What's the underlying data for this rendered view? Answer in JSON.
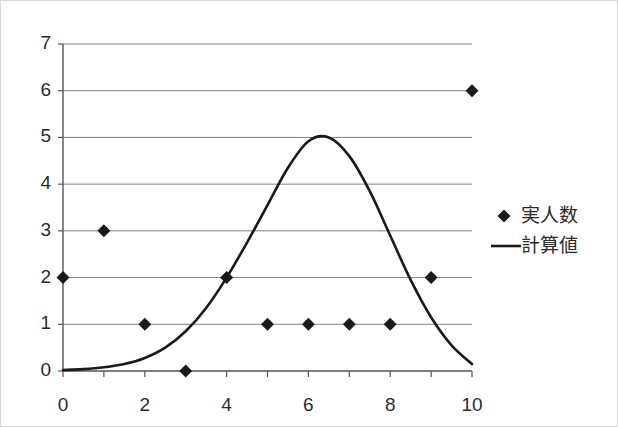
{
  "chart_data": {
    "type": "scatter",
    "title": "",
    "xlabel": "",
    "ylabel": "",
    "xlim": [
      0,
      10
    ],
    "ylim": [
      0,
      7
    ],
    "grid": true,
    "grid_axis": "y",
    "legend_position": "right",
    "x_ticks": [
      0,
      1,
      2,
      3,
      4,
      5,
      6,
      7,
      8,
      9,
      10
    ],
    "x_tick_labels": [
      "0",
      "",
      "2",
      "",
      "4",
      "",
      "6",
      "",
      "8",
      "",
      "10"
    ],
    "y_ticks": [
      0,
      1,
      2,
      3,
      4,
      5,
      6,
      7
    ],
    "y_tick_labels": [
      "0",
      "1",
      "2",
      "3",
      "4",
      "5",
      "6",
      "7"
    ],
    "series": [
      {
        "name": "実人数",
        "type": "scatter",
        "marker": "diamond",
        "color": "#1a1a1a",
        "x": [
          0,
          1,
          2,
          3,
          4,
          5,
          6,
          7,
          8,
          9,
          10
        ],
        "values": [
          2,
          3,
          1,
          0,
          2,
          1,
          1,
          1,
          1,
          2,
          6
        ]
      },
      {
        "name": "計算値",
        "type": "line",
        "color": "#1a1a1a",
        "x": [
          0,
          0.5,
          1,
          1.5,
          2,
          2.5,
          3,
          3.5,
          4,
          4.5,
          5,
          5.5,
          6,
          6.5,
          7,
          7.5,
          8,
          8.5,
          9,
          9.5,
          10
        ],
        "values": [
          0.02,
          0.04,
          0.08,
          0.15,
          0.28,
          0.5,
          0.85,
          1.35,
          2.0,
          2.75,
          3.55,
          4.35,
          4.92,
          5.0,
          4.6,
          3.85,
          2.9,
          1.95,
          1.15,
          0.55,
          0.15
        ]
      }
    ]
  },
  "legend": {
    "entries": [
      {
        "label": "実人数",
        "marker": "diamond"
      },
      {
        "label": "計算値",
        "marker": "line"
      }
    ]
  },
  "colors": {
    "axis": "#555555",
    "grid": "#808080",
    "series": "#1a1a1a",
    "text": "#2b2b2b",
    "background": "#ffffff",
    "border": "#d8d8d8"
  }
}
